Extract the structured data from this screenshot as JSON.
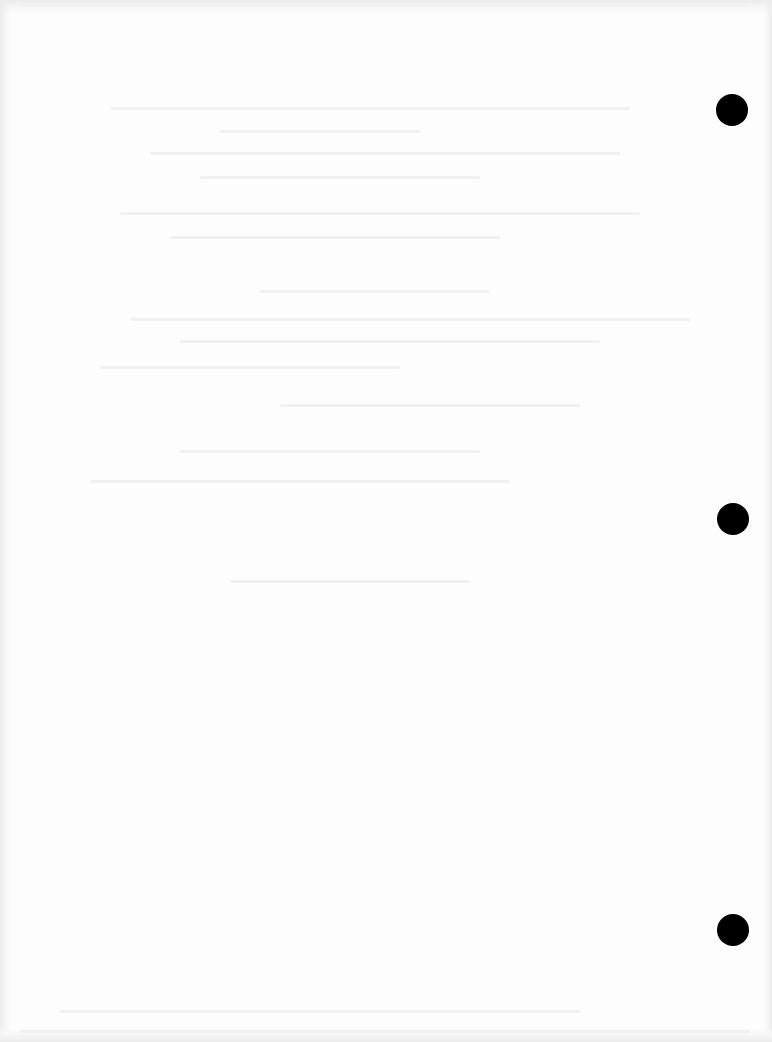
{
  "document": {
    "type": "scanned-blank-page",
    "background_color": "#fdfdfd",
    "bleed_through_text_legible": false,
    "punch_holes": [
      {
        "cx": 732,
        "cy": 110,
        "diameter": 32,
        "color": "#000000"
      },
      {
        "cx": 733,
        "cy": 519,
        "diameter": 32,
        "color": "#000000"
      },
      {
        "cx": 733,
        "cy": 930,
        "diameter": 32,
        "color": "#000000"
      }
    ]
  }
}
